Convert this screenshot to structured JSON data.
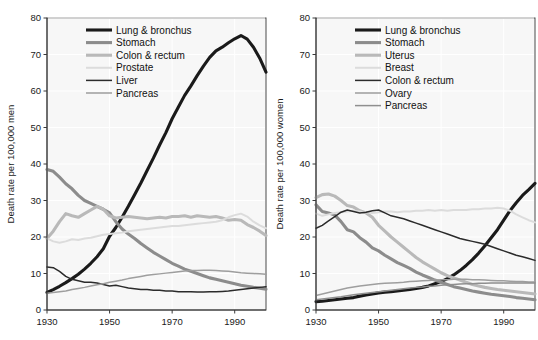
{
  "figure": {
    "background": "#ffffff",
    "panel_background": "#f7f7f7",
    "grid_color": "#ffffff",
    "axis_color": "#3a3a3a"
  },
  "chart_data": [
    {
      "id": "men",
      "type": "line",
      "title": "",
      "xlabel": "",
      "ylabel": "Death rate per 100,000 men",
      "xlim": [
        1930,
        2000
      ],
      "ylim": [
        0,
        80
      ],
      "xticks": [
        1930,
        1950,
        1970,
        1990
      ],
      "yticks": [
        0,
        10,
        20,
        30,
        40,
        50,
        60,
        70,
        80
      ],
      "grid": true,
      "legend_position": "top-left-inside",
      "x": [
        1930,
        1932,
        1934,
        1936,
        1938,
        1940,
        1942,
        1944,
        1946,
        1948,
        1950,
        1952,
        1954,
        1956,
        1958,
        1960,
        1962,
        1964,
        1966,
        1968,
        1970,
        1972,
        1974,
        1976,
        1978,
        1980,
        1982,
        1984,
        1986,
        1988,
        1990,
        1992,
        1994,
        1996,
        1998,
        2000
      ],
      "series": [
        {
          "name": "Lung & bronchus",
          "color": "#1a1a1a",
          "width": 3.1,
          "values": [
            4.8,
            5.6,
            6.5,
            7.5,
            8.6,
            9.8,
            11.2,
            12.8,
            14.6,
            16.8,
            20.2,
            22.6,
            25.4,
            28.4,
            31.6,
            34.8,
            38.2,
            41.6,
            45.2,
            48.6,
            52.4,
            55.6,
            58.8,
            61.4,
            64.2,
            66.8,
            69.2,
            71.0,
            72.0,
            73.2,
            74.3,
            75.2,
            74.2,
            72.0,
            69.0,
            65.2
          ]
        },
        {
          "name": "Stomach",
          "color": "#8c8c8c",
          "width": 3.1,
          "values": [
            38.5,
            38.0,
            36.4,
            34.6,
            33.2,
            31.4,
            30.0,
            29.2,
            28.4,
            27.6,
            26.6,
            24.2,
            22.2,
            20.8,
            19.6,
            18.2,
            17.0,
            15.8,
            14.8,
            13.8,
            12.8,
            12.0,
            11.2,
            10.6,
            10.0,
            9.4,
            8.8,
            8.4,
            8.0,
            7.6,
            7.2,
            6.8,
            6.5,
            6.2,
            6.0,
            5.7
          ]
        },
        {
          "name": "Colon & rectum",
          "color": "#b9b9b9",
          "width": 3.1,
          "values": [
            19.6,
            21.6,
            24.2,
            26.4,
            25.8,
            25.4,
            26.4,
            27.4,
            28.4,
            27.6,
            25.8,
            25.2,
            25.4,
            25.6,
            25.4,
            25.2,
            25.0,
            25.2,
            25.4,
            25.2,
            25.6,
            25.6,
            25.8,
            25.4,
            25.8,
            25.6,
            25.4,
            25.6,
            25.2,
            24.6,
            24.8,
            24.6,
            23.4,
            22.6,
            21.6,
            20.4
          ]
        },
        {
          "name": "Prostate",
          "color": "#dcdcdc",
          "width": 2.0,
          "values": [
            19.6,
            18.8,
            18.4,
            18.8,
            19.4,
            19.2,
            19.6,
            19.8,
            20.2,
            20.6,
            20.8,
            21.0,
            21.2,
            21.6,
            21.8,
            22.0,
            22.2,
            22.4,
            22.6,
            22.8,
            23.0,
            23.0,
            23.2,
            23.4,
            23.6,
            23.8,
            24.0,
            24.2,
            24.6,
            25.4,
            26.0,
            26.4,
            25.6,
            24.2,
            23.2,
            22.4
          ]
        },
        {
          "name": "Liver",
          "color": "#2b2b2b",
          "width": 1.5,
          "values": [
            11.8,
            11.6,
            10.6,
            9.2,
            8.4,
            8.0,
            7.6,
            7.6,
            7.4,
            7.0,
            6.6,
            6.8,
            6.4,
            6.0,
            5.8,
            5.6,
            5.6,
            5.4,
            5.4,
            5.2,
            5.2,
            5.0,
            5.0,
            5.0,
            4.9,
            4.9,
            5.0,
            5.0,
            5.1,
            5.2,
            5.4,
            5.6,
            5.8,
            6.0,
            6.2,
            6.4
          ]
        },
        {
          "name": "Pancreas",
          "color": "#9e9e9e",
          "width": 1.5,
          "values": [
            4.6,
            4.8,
            5.0,
            5.2,
            5.6,
            5.9,
            6.2,
            6.6,
            6.9,
            7.2,
            7.6,
            7.9,
            8.2,
            8.6,
            8.9,
            9.2,
            9.5,
            9.7,
            9.9,
            10.1,
            10.3,
            10.5,
            10.7,
            10.8,
            10.8,
            10.9,
            10.9,
            10.8,
            10.7,
            10.6,
            10.4,
            10.2,
            10.1,
            10.0,
            9.9,
            9.8
          ]
        }
      ]
    },
    {
      "id": "women",
      "type": "line",
      "title": "",
      "xlabel": "",
      "ylabel": "Death rate per 100,000 women",
      "xlim": [
        1930,
        2000
      ],
      "ylim": [
        0,
        80
      ],
      "xticks": [
        1930,
        1950,
        1970,
        1990
      ],
      "yticks": [
        0,
        10,
        20,
        30,
        40,
        50,
        60,
        70,
        80
      ],
      "grid": true,
      "legend_position": "top-left-inside",
      "x": [
        1930,
        1932,
        1934,
        1936,
        1938,
        1940,
        1942,
        1944,
        1946,
        1948,
        1950,
        1952,
        1954,
        1956,
        1958,
        1960,
        1962,
        1964,
        1966,
        1968,
        1970,
        1972,
        1974,
        1976,
        1978,
        1980,
        1982,
        1984,
        1986,
        1988,
        1990,
        1992,
        1994,
        1996,
        1998,
        2000
      ],
      "series": [
        {
          "name": "Lung & bronchus",
          "color": "#1a1a1a",
          "width": 3.1,
          "values": [
            2.3,
            2.4,
            2.6,
            2.8,
            3.0,
            3.2,
            3.4,
            3.8,
            4.1,
            4.4,
            4.7,
            4.9,
            5.0,
            5.2,
            5.4,
            5.6,
            5.9,
            6.2,
            6.6,
            7.2,
            7.8,
            8.6,
            9.6,
            10.8,
            12.2,
            13.8,
            15.6,
            17.6,
            19.8,
            22.0,
            24.6,
            27.2,
            29.4,
            31.4,
            33.0,
            34.7
          ]
        },
        {
          "name": "Stomach",
          "color": "#8c8c8c",
          "width": 3.1,
          "values": [
            28.8,
            27.0,
            26.6,
            26.0,
            24.2,
            22.0,
            21.4,
            19.8,
            18.6,
            17.0,
            16.2,
            15.0,
            14.0,
            13.0,
            12.2,
            11.4,
            10.4,
            9.6,
            8.9,
            8.2,
            7.6,
            7.0,
            6.4,
            6.0,
            5.6,
            5.2,
            4.9,
            4.6,
            4.3,
            4.1,
            3.9,
            3.7,
            3.4,
            3.2,
            3.0,
            2.8
          ]
        },
        {
          "name": "Uterus",
          "color": "#b9b9b9",
          "width": 3.1,
          "values": [
            30.8,
            31.6,
            31.8,
            31.2,
            30.0,
            28.6,
            28.2,
            27.2,
            26.6,
            25.4,
            23.2,
            21.6,
            20.0,
            18.6,
            17.2,
            15.8,
            14.4,
            13.2,
            12.2,
            11.2,
            10.2,
            9.4,
            8.8,
            8.2,
            7.6,
            7.0,
            6.6,
            6.2,
            5.9,
            5.6,
            5.4,
            5.2,
            5.0,
            4.8,
            4.6,
            4.4
          ]
        },
        {
          "name": "Breast",
          "color": "#dcdcdc",
          "width": 2.0,
          "values": [
            26.4,
            25.8,
            26.2,
            26.6,
            26.8,
            27.0,
            27.2,
            27.0,
            26.8,
            26.6,
            26.8,
            27.0,
            27.0,
            26.8,
            27.0,
            27.0,
            27.2,
            27.2,
            27.4,
            27.2,
            27.4,
            27.2,
            27.4,
            27.4,
            27.4,
            27.6,
            27.6,
            27.8,
            27.8,
            28.0,
            27.8,
            27.2,
            26.2,
            25.4,
            24.6,
            24.0
          ]
        },
        {
          "name": "Colon & rectum",
          "color": "#2b2b2b",
          "width": 1.5,
          "values": [
            22.4,
            23.2,
            24.4,
            25.6,
            26.8,
            27.4,
            27.0,
            26.6,
            26.8,
            27.2,
            27.4,
            26.6,
            25.8,
            25.4,
            25.0,
            24.4,
            23.8,
            23.2,
            22.6,
            22.0,
            21.4,
            20.8,
            20.2,
            19.6,
            19.2,
            18.8,
            18.4,
            18.0,
            17.4,
            16.8,
            16.2,
            15.6,
            15.0,
            14.6,
            14.1,
            13.6
          ]
        },
        {
          "name": "Ovary",
          "color": "#9e9e9e",
          "width": 1.5,
          "values": [
            4.0,
            4.4,
            4.8,
            5.2,
            5.6,
            6.0,
            6.3,
            6.6,
            6.8,
            7.0,
            7.2,
            7.3,
            7.4,
            7.5,
            7.6,
            7.8,
            7.9,
            8.0,
            8.1,
            8.2,
            8.3,
            8.3,
            8.4,
            8.4,
            8.4,
            8.3,
            8.3,
            8.2,
            8.1,
            8.0,
            8.0,
            7.9,
            7.8,
            7.8,
            7.7,
            7.7
          ]
        },
        {
          "name": "Pancreas",
          "color": "#8f8f8f",
          "width": 1.5,
          "values": [
            2.8,
            3.0,
            3.2,
            3.4,
            3.6,
            3.9,
            4.2,
            4.4,
            4.6,
            4.8,
            5.0,
            5.2,
            5.4,
            5.6,
            5.8,
            6.0,
            6.2,
            6.3,
            6.5,
            6.6,
            6.8,
            6.9,
            7.0,
            7.1,
            7.2,
            7.2,
            7.3,
            7.3,
            7.4,
            7.4,
            7.4,
            7.4,
            7.4,
            7.4,
            7.4,
            7.4
          ]
        }
      ]
    }
  ]
}
